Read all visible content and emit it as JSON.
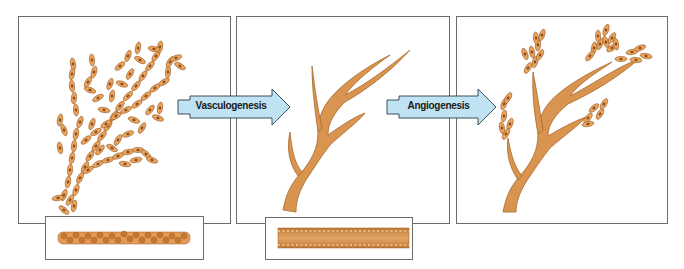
{
  "diagram": {
    "panels": [
      {
        "id": "scattered-cells",
        "description": "loosely connected angioblast cells"
      },
      {
        "id": "primitive-network",
        "description": "branched vessel network"
      },
      {
        "id": "sprouting-vessels",
        "description": "vessel network with sprouting cell clusters"
      }
    ],
    "arrows": [
      {
        "label": "Vasculogenesis"
      },
      {
        "label": "Angiogenesis"
      }
    ],
    "insets": [
      {
        "id": "cell-aggregate-cross-section",
        "description": "aggregated endothelial cells"
      },
      {
        "id": "vessel-tube-cross-section",
        "description": "lumen-forming vessel tube"
      }
    ],
    "colors": {
      "cell_fill": "#e8a35c",
      "cell_stroke": "#9a5a24",
      "nucleus": "#8a4a1c",
      "vessel_fill": "#d9954f",
      "vessel_shade": "#b8742f",
      "arrow_fill": "#bfe3f2",
      "arrow_stroke": "#3a4f5c",
      "border": "#6b6b6b"
    }
  }
}
